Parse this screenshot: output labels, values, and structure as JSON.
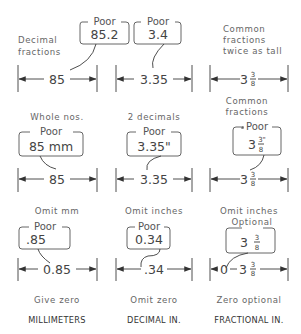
{
  "columns": [
    "MILLIMETERS",
    "DECIMAL IN.",
    "FRACTIONAL IN."
  ],
  "rows": [
    {
      "notes": {
        "left": [
          "Decimal",
          "fractions"
        ],
        "right": [
          "Common",
          "fractions",
          "twice as tall"
        ]
      },
      "callouts": [
        {
          "tag": "Poor",
          "value": "85.2"
        },
        {
          "tag": "Poor",
          "value": "3.4"
        }
      ],
      "dimensions": [
        {
          "value": "85"
        },
        {
          "value": "3.35"
        },
        {
          "whole": "3",
          "num": "3",
          "den": "8"
        }
      ],
      "captions": [
        "Whole nos.",
        "2 decimals",
        "Common fractions"
      ]
    },
    {
      "callouts": [
        {
          "tag": "Poor",
          "value": "85 mm"
        },
        {
          "tag": "Poor",
          "value": "3.35\""
        },
        {
          "tag": "Poor",
          "whole": "3",
          "num": "3\"",
          "den": "8"
        }
      ],
      "dimensions": [
        {
          "value": "85"
        },
        {
          "value": "3.35"
        },
        {
          "whole": "3",
          "num": "3",
          "den": "8"
        }
      ],
      "captions": [
        "Omit mm",
        "Omit inches",
        "Omit inches"
      ]
    },
    {
      "callouts": [
        {
          "tag": "Poor",
          "value": ".85"
        },
        {
          "tag": "Poor",
          "value": "0.34"
        },
        {
          "tag": "Optional",
          "whole": "3",
          "num": "3",
          "den": "8"
        }
      ],
      "dimensions": [
        {
          "value": "0.85"
        },
        {
          "value": ".34"
        },
        {
          "prefix": "0",
          "whole": "3",
          "num": "3",
          "den": "8"
        }
      ],
      "captions": [
        "Give zero",
        "Omit zero",
        "Zero optional"
      ]
    }
  ]
}
